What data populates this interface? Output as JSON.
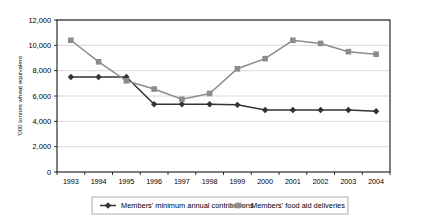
{
  "chart_data": {
    "type": "line",
    "title": "",
    "xlabel": "",
    "ylabel": "'000 tonnes wheat equivalent",
    "categories": [
      "1993",
      "1994",
      "1995",
      "1996",
      "1997",
      "1998",
      "1999",
      "2000",
      "2001",
      "2002",
      "2003",
      "2004"
    ],
    "ylim": [
      0,
      12000
    ],
    "yticks": [
      0,
      2000,
      4000,
      6000,
      8000,
      10000,
      12000
    ],
    "ytick_labels": [
      "0",
      "2,000",
      "4,000",
      "6,000",
      "8,000",
      "10,000",
      "12,000"
    ],
    "grid": true,
    "legend_position": "bottom",
    "series": [
      {
        "name": "Members' minimum annual contributions",
        "color": "#333333",
        "marker": "diamond",
        "values": [
          7500,
          7500,
          7500,
          5350,
          5350,
          5350,
          5300,
          4900,
          4900,
          4900,
          4900,
          4800
        ]
      },
      {
        "name": "Members' food aid deliveries",
        "color": "#8c8c8c",
        "marker": "square",
        "values": [
          10400,
          8700,
          7200,
          6550,
          5750,
          6200,
          8150,
          8950,
          10400,
          10150,
          9500,
          9300
        ]
      }
    ]
  },
  "legend": {
    "items": [
      {
        "label": "Members' minimum annual contributions",
        "color": "#333333",
        "marker": "diamond"
      },
      {
        "label": "Members' food aid deliveries",
        "color": "#8c8c8c",
        "marker": "square"
      }
    ]
  },
  "axis": {
    "y_title": "'000 tonnes wheat equivalent"
  }
}
